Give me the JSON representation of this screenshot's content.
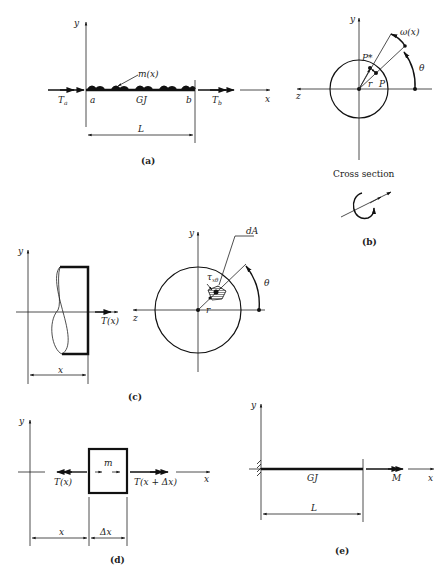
{
  "figure": {
    "panels": [
      {
        "id": "a",
        "caption": "(a)",
        "labels": {
          "y_axis": "y",
          "x_axis": "x",
          "left_torque": "T_a",
          "left_torque_main": "T",
          "left_torque_sub": "a",
          "right_torque_main": "T",
          "right_torque_sub": "b",
          "end_a": "a",
          "end_b": "b",
          "stiffness": "GJ",
          "distributed_torque": "m(x)",
          "length": "L"
        }
      },
      {
        "id": "b",
        "caption": "(b)",
        "labels": {
          "y_axis": "y",
          "z_axis": "z",
          "displacement": "ω(x)",
          "angle": "θ",
          "point_deformed": "P*",
          "point": "P",
          "radius": "r",
          "subtitle": "Cross section"
        }
      },
      {
        "id": "c",
        "caption": "(c)",
        "labels": {
          "y_axis": "y",
          "z_axis": "z",
          "internal_torque": "T(x)",
          "position": "x",
          "area_element": "dA",
          "shear_stress": "τ",
          "shear_stress_sub": "xθ",
          "radius": "r",
          "angle": "θ"
        }
      },
      {
        "id": "d",
        "caption": "(d)",
        "labels": {
          "y_axis": "y",
          "x_axis": "x",
          "left_torque": "T(x)",
          "right_torque": "T(x + Δx)",
          "distributed": "m",
          "position": "x",
          "increment": "Δx"
        }
      },
      {
        "id": "e",
        "caption": "(e)",
        "labels": {
          "y_axis": "y",
          "x_axis": "x",
          "stiffness": "GJ",
          "moment": "M",
          "length": "L"
        }
      }
    ]
  }
}
